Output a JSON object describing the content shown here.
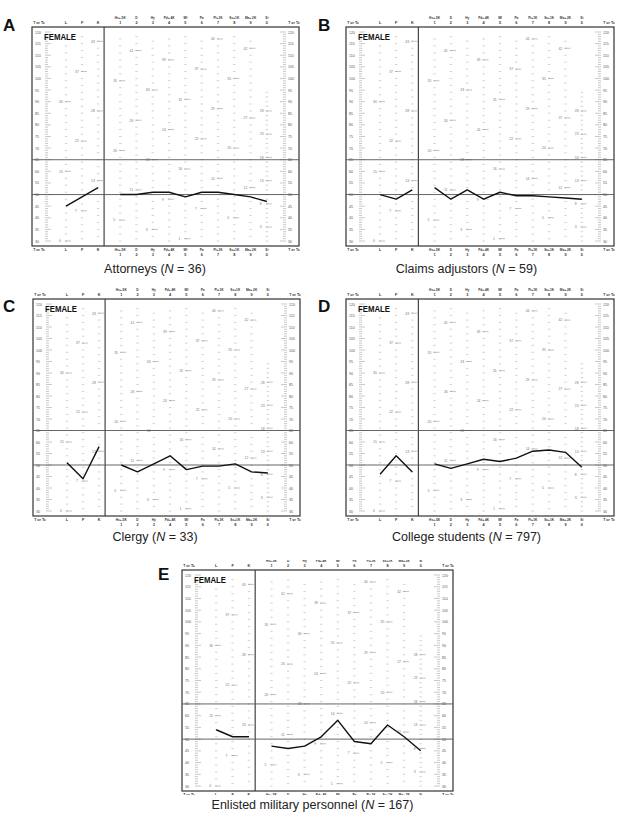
{
  "figure": {
    "y_axis_label": "T or Tc",
    "y_ticks": [
      120,
      115,
      110,
      105,
      100,
      95,
      90,
      85,
      80,
      75,
      70,
      65,
      60,
      55,
      50,
      45,
      40,
      35,
      30
    ],
    "reference_lines": [
      65,
      50
    ],
    "sex_label": "FEMALE",
    "validity_scales": [
      {
        "name": "L",
        "number": ""
      },
      {
        "name": "F",
        "number": ""
      },
      {
        "name": "K",
        "number": ""
      }
    ],
    "clinical_scales": [
      {
        "name": "Hs+.5K",
        "number": "1"
      },
      {
        "name": "D",
        "number": "2"
      },
      {
        "name": "Hy",
        "number": "3"
      },
      {
        "name": "Pd+.4K",
        "number": "4"
      },
      {
        "name": "Mf",
        "number": "5"
      },
      {
        "name": "Pa",
        "number": "6"
      },
      {
        "name": "Pt+1K",
        "number": "7"
      },
      {
        "name": "Sc+1K",
        "number": "8"
      },
      {
        "name": "Ma+.2K",
        "number": "9"
      },
      {
        "name": "Si",
        "number": "0"
      }
    ]
  },
  "panels": [
    {
      "letter": "A",
      "group": "Attorneys",
      "n_label": "N",
      "n": "36",
      "caption_suffix": " = 36)",
      "caption_prefix": "Attorneys ("
    },
    {
      "letter": "B",
      "group": "Claims adjustors",
      "n_label": "N",
      "n": "59",
      "caption_prefix": "Claims adjustors (",
      "caption_suffix": " = 59)"
    },
    {
      "letter": "C",
      "group": "Clergy",
      "n_label": "N",
      "n": "33",
      "caption_prefix": "Clergy (",
      "caption_suffix": " = 33)"
    },
    {
      "letter": "D",
      "group": "College students",
      "n_label": "N",
      "n": "797",
      "caption_prefix": "College students (",
      "caption_suffix": " = 797)"
    },
    {
      "letter": "E",
      "group": "Enlisted military personnel",
      "n_label": "N",
      "n": "167",
      "caption_prefix": "Enlisted military personnel (",
      "caption_suffix": " = 167)"
    }
  ],
  "chart_data": [
    {
      "type": "line",
      "title": "Attorneys (N = 36)",
      "panel": "A",
      "xlabel": "MMPI scales",
      "ylabel": "T or Tc",
      "ylim": [
        30,
        120
      ],
      "categories": [
        "L",
        "F",
        "K",
        "1",
        "2",
        "3",
        "4",
        "5",
        "6",
        "7",
        "8",
        "9",
        "0"
      ],
      "series": [
        {
          "name": "Validity (L-F-K)",
          "x": [
            "L",
            "F",
            "K"
          ],
          "values": [
            45,
            49,
            53
          ]
        },
        {
          "name": "Clinical (1-0)",
          "x": [
            "1",
            "2",
            "3",
            "4",
            "5",
            "6",
            "7",
            "8",
            "9",
            "0"
          ],
          "values": [
            50,
            50,
            51,
            51,
            49,
            51,
            51,
            50,
            49,
            47
          ]
        }
      ],
      "reference_lines": [
        65,
        50
      ],
      "grid": false
    },
    {
      "type": "line",
      "title": "Claims adjustors (N = 59)",
      "panel": "B",
      "xlabel": "MMPI scales",
      "ylabel": "T or Tc",
      "ylim": [
        30,
        120
      ],
      "categories": [
        "L",
        "F",
        "K",
        "1",
        "2",
        "3",
        "4",
        "5",
        "6",
        "7",
        "8",
        "9",
        "0"
      ],
      "series": [
        {
          "name": "Validity (L-F-K)",
          "x": [
            "L",
            "F",
            "K"
          ],
          "values": [
            50,
            48,
            52
          ]
        },
        {
          "name": "Clinical (1-0)",
          "x": [
            "1",
            "2",
            "3",
            "4",
            "5",
            "6",
            "7",
            "8",
            "9",
            "0"
          ],
          "values": [
            53,
            48,
            52,
            48,
            51,
            49.5,
            49.5,
            49,
            48.5,
            48
          ]
        }
      ],
      "reference_lines": [
        65,
        50
      ],
      "grid": false
    },
    {
      "type": "line",
      "title": "Clergy (N = 33)",
      "panel": "C",
      "xlabel": "MMPI scales",
      "ylabel": "T or Tc",
      "ylim": [
        30,
        120
      ],
      "categories": [
        "L",
        "F",
        "K",
        "1",
        "2",
        "3",
        "4",
        "5",
        "6",
        "7",
        "8",
        "9",
        "0"
      ],
      "series": [
        {
          "name": "Validity (L-F-K)",
          "x": [
            "L",
            "F",
            "K"
          ],
          "values": [
            51,
            44,
            58
          ]
        },
        {
          "name": "Clinical (1-0)",
          "x": [
            "1",
            "2",
            "3",
            "4",
            "5",
            "6",
            "7",
            "8",
            "9",
            "0"
          ],
          "values": [
            50,
            47,
            50.5,
            54,
            48,
            49.5,
            49.5,
            50.5,
            47,
            46.5
          ]
        }
      ],
      "reference_lines": [
        65,
        50
      ],
      "grid": false
    },
    {
      "type": "line",
      "title": "College students (N = 797)",
      "panel": "D",
      "xlabel": "MMPI scales",
      "ylabel": "T or Tc",
      "ylim": [
        30,
        120
      ],
      "categories": [
        "L",
        "F",
        "K",
        "1",
        "2",
        "3",
        "4",
        "5",
        "6",
        "7",
        "8",
        "9",
        "0"
      ],
      "series": [
        {
          "name": "Validity (L-F-K)",
          "x": [
            "L",
            "F",
            "K"
          ],
          "values": [
            46,
            54,
            47
          ]
        },
        {
          "name": "Clinical (1-0)",
          "x": [
            "1",
            "2",
            "3",
            "4",
            "5",
            "6",
            "7",
            "8",
            "9",
            "0"
          ],
          "values": [
            50.5,
            48.5,
            50.5,
            52.5,
            51.5,
            53,
            56,
            56.5,
            55.5,
            49
          ]
        }
      ],
      "reference_lines": [
        65,
        50
      ],
      "grid": false
    },
    {
      "type": "line",
      "title": "Enlisted military personnel (N = 167)",
      "panel": "E",
      "xlabel": "MMPI scales",
      "ylabel": "T or Tc",
      "ylim": [
        30,
        120
      ],
      "categories": [
        "L",
        "F",
        "K",
        "1",
        "2",
        "3",
        "4",
        "5",
        "6",
        "7",
        "8",
        "9",
        "0"
      ],
      "series": [
        {
          "name": "Validity (L-F-K)",
          "x": [
            "L",
            "F",
            "K"
          ],
          "values": [
            54,
            51,
            51
          ]
        },
        {
          "name": "Clinical (1-0)",
          "x": [
            "1",
            "2",
            "3",
            "4",
            "5",
            "6",
            "7",
            "8",
            "9",
            "0"
          ],
          "values": [
            47,
            46,
            47,
            51,
            58,
            49,
            48,
            56,
            51,
            45
          ]
        }
      ],
      "reference_lines": [
        65,
        50
      ],
      "grid": false
    }
  ]
}
